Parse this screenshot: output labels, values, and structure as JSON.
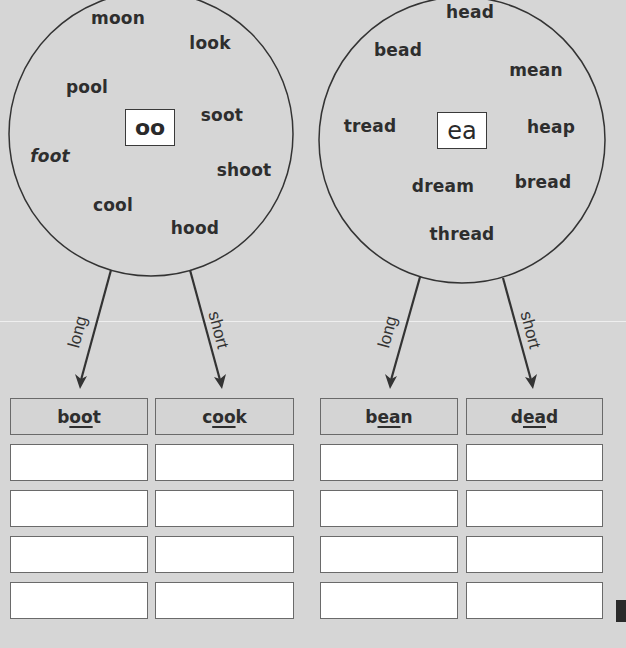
{
  "worksheet": {
    "left_group": {
      "grapheme": "oo",
      "words": [
        {
          "text": "moon",
          "x": 118,
          "y": 18
        },
        {
          "text": "look",
          "x": 210,
          "y": 43
        },
        {
          "text": "pool",
          "x": 87,
          "y": 87
        },
        {
          "text": "soot",
          "x": 222,
          "y": 115
        },
        {
          "text": "foot",
          "x": 50,
          "y": 156,
          "italic": true
        },
        {
          "text": "shoot",
          "x": 244,
          "y": 170
        },
        {
          "text": "cool",
          "x": 113,
          "y": 205
        },
        {
          "text": "hood",
          "x": 195,
          "y": 228
        }
      ],
      "arrow_long_label": "long",
      "arrow_short_label": "short",
      "columns": [
        {
          "pre": "b",
          "focus": "oo",
          "post": "t",
          "full": "boot"
        },
        {
          "pre": "c",
          "focus": "oo",
          "post": "k",
          "full": "cook"
        }
      ],
      "answer_rows": 4
    },
    "right_group": {
      "grapheme": "ea",
      "words": [
        {
          "text": "head",
          "x": 470,
          "y": 12
        },
        {
          "text": "bead",
          "x": 398,
          "y": 50
        },
        {
          "text": "mean",
          "x": 536,
          "y": 70
        },
        {
          "text": "tread",
          "x": 370,
          "y": 126
        },
        {
          "text": "heap",
          "x": 551,
          "y": 127
        },
        {
          "text": "bread",
          "x": 543,
          "y": 182
        },
        {
          "text": "dream",
          "x": 443,
          "y": 186
        },
        {
          "text": "thread",
          "x": 462,
          "y": 234
        }
      ],
      "arrow_long_label": "long",
      "arrow_short_label": "short",
      "columns": [
        {
          "pre": "b",
          "focus": "ea",
          "post": "n",
          "full": "bean"
        },
        {
          "pre": "d",
          "focus": "ea",
          "post": "d",
          "full": "dead"
        }
      ],
      "answer_rows": 4
    },
    "colors": {
      "background": "#d6d6d6",
      "ink": "#2e2e2e",
      "box_border": "#6a6a6a",
      "answer_fill": "#ffffff"
    }
  }
}
